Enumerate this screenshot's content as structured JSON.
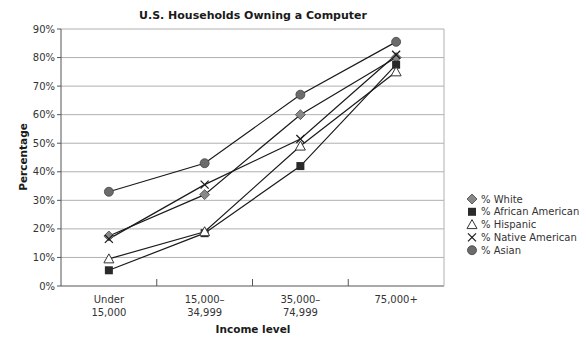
{
  "chart_data": {
    "type": "line",
    "title": "U.S. Households Owning a Computer",
    "xlabel": "Income level",
    "ylabel": "Percentage",
    "categories": [
      [
        "Under",
        "15,000"
      ],
      [
        "15,000–",
        "34,999"
      ],
      [
        "35,000–",
        "74,999"
      ],
      [
        "75,000+"
      ]
    ],
    "yticks": [
      "0%",
      "10%",
      "20%",
      "30%",
      "40%",
      "50%",
      "60%",
      "70%",
      "80%",
      "90%"
    ],
    "ylim": [
      0,
      90
    ],
    "grid": true,
    "legend_position": "right",
    "series": [
      {
        "name": "% White",
        "marker": "diamond",
        "color": "#888888",
        "values": [
          17.5,
          32,
          60,
          80
        ]
      },
      {
        "name": "% African American",
        "marker": "square",
        "color": "#2a2a2a",
        "values": [
          5.5,
          18.5,
          42,
          77.5
        ]
      },
      {
        "name": "% Hispanic",
        "marker": "triangle",
        "color": "#ffffff",
        "values": [
          9.5,
          19,
          49,
          75
        ]
      },
      {
        "name": "% Native American",
        "marker": "cross",
        "color": "#1a1a1a",
        "values": [
          16.5,
          35.5,
          51.5,
          81
        ]
      },
      {
        "name": "% Asian",
        "marker": "circle",
        "color": "#6b6b6b",
        "values": [
          33,
          43,
          67,
          85.5
        ]
      }
    ]
  }
}
